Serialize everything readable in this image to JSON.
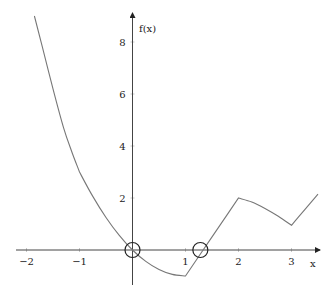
{
  "chart_data": {
    "type": "line",
    "title": "",
    "xlabel": "x",
    "ylabel": "f(x)",
    "xlim": [
      -2.2,
      3.6
    ],
    "ylim": [
      -1.4,
      9.1
    ],
    "grid": false,
    "x_ticks": [
      -2,
      -1,
      1,
      2,
      3
    ],
    "x_tick_labels": [
      "−2",
      "−1",
      "1",
      "2",
      "3"
    ],
    "y_ticks": [
      2,
      4,
      6,
      8
    ],
    "y_tick_labels": [
      "2",
      "4",
      "6",
      "8"
    ],
    "series": [
      {
        "name": "f(x)",
        "x": [
          -1.85,
          -1.7,
          -1.5,
          -1.3,
          -1.15,
          -1.0,
          -0.75,
          -0.5,
          -0.25,
          0.0,
          0.25,
          0.5,
          0.75,
          1.0,
          1.333,
          1.7,
          2.0,
          2.25,
          2.5,
          2.75,
          3.0,
          3.25,
          3.5
        ],
        "y": [
          9.0,
          7.8,
          6.2,
          4.7,
          3.8,
          3.0,
          2.06,
          1.25,
          0.56,
          0.0,
          -0.44,
          -0.75,
          -0.94,
          -1.0,
          0.0,
          1.1,
          2.0,
          1.85,
          1.6,
          1.3,
          0.95,
          1.55,
          2.15
        ]
      }
    ],
    "annotations": [
      {
        "type": "circle-marker",
        "x": 0.0,
        "y": 0.0,
        "label": "root"
      },
      {
        "type": "circle-marker",
        "x": 1.28,
        "y": 0.0,
        "label": "root"
      }
    ]
  }
}
